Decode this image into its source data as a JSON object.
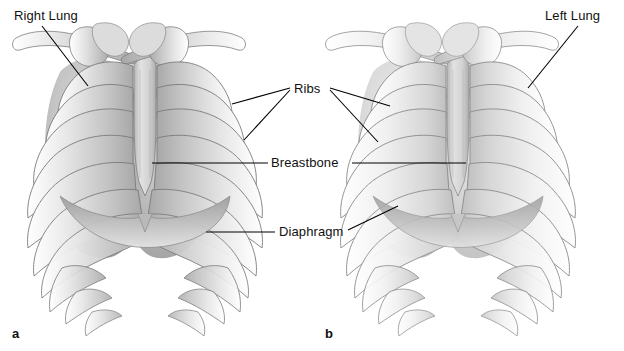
{
  "figure": {
    "background_color": "#ffffff",
    "width": 624,
    "height": 351,
    "label_color": "#111111",
    "leader_color": "#000000",
    "bone_light": "#e9e9e9",
    "bone_mid": "#c9c9c9",
    "bone_dark": "#9a9a9a",
    "outline": "#6a6a6a",
    "lung_shade": "#b0b0b0"
  },
  "labels": {
    "right_lung": "Right Lung",
    "left_lung": "Left Lung",
    "ribs": "Ribs",
    "breastbone": "Breastbone",
    "diaphragm": "Diaphragm"
  },
  "panels": [
    {
      "letter": "a",
      "x": 12,
      "y": 326,
      "caption": "a"
    },
    {
      "letter": "b",
      "x": 325,
      "y": 326,
      "caption": "b"
    }
  ],
  "label_positions": {
    "right_lung": {
      "x": 14,
      "y": 9
    },
    "left_lung": {
      "x": 545,
      "y": 9
    },
    "ribs": {
      "x": 294,
      "y": 83
    },
    "breastbone": {
      "x": 271,
      "y": 156
    },
    "diaphragm": {
      "x": 278,
      "y": 225
    }
  },
  "anatomy": {
    "structures": [
      "clavicle",
      "scapula",
      "humeral-head",
      "sternum",
      "ribs",
      "costal-cartilage",
      "lung-right",
      "lung-left",
      "diaphragm"
    ],
    "rib_pairs": 10
  }
}
